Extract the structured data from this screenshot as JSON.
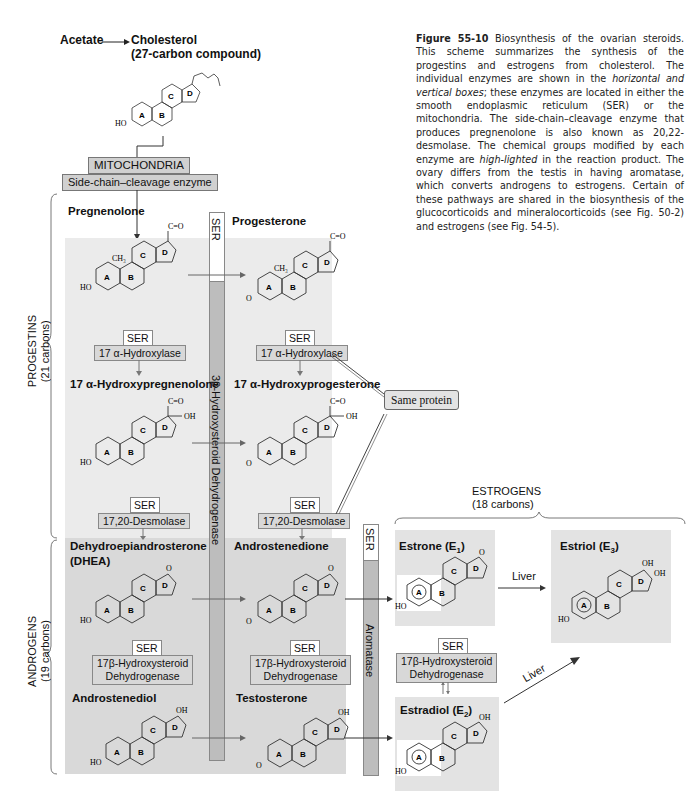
{
  "header": {
    "acetate": "Acetate",
    "arrow": "→",
    "cholesterol": "Cholesterol",
    "cholesterol_sub": "(27-carbon compound)"
  },
  "caption": {
    "figure_label": "Figure 55-10",
    "text_1": " Biosynthesis of the ovarian steroids. This scheme summarizes the synthesis of the progestins and estrogens from cholesterol. The individual enzymes are shown in the ",
    "text_italic_1": "horizontal and vertical boxes",
    "text_2": "; these enzymes are located in either the smooth endoplasmic reticulum (SER) or the mitochondria. The side-chain–cleavage enzyme that produces pregnenolone is also known as 20,22-desmolase. The chemical groups modified by each enzyme are ",
    "text_italic_2": "high-lighted",
    "text_3": " in the reaction product. The ovary differs from the testis in having aromatase, which converts androgens to estrogens. Certain of these pathways are shared in the biosynthesis of the glucocorticoids and mineralocorticoids (see Fig. 50-2) and estrogens (see Fig. 54-5)."
  },
  "mitochondria": {
    "location": "MITOCHONDRIA",
    "enzyme": "Side-chain–cleavage enzyme"
  },
  "groups": {
    "progestins": {
      "name": "PROGESTINS",
      "sub": "(21 carbons)"
    },
    "androgens": {
      "name": "ANDROGENS",
      "sub": "(19 carbons)"
    },
    "estrogens": {
      "name": "ESTROGENS",
      "sub": "(18 carbons)"
    }
  },
  "compounds": {
    "pregnenolone": "Pregnenolone",
    "progesterone": "Progesterone",
    "hydroxypregnenolone": "17 α-Hydroxypregnenolone",
    "hydroxyprogesterone": "17 α-Hydroxyprogesterone",
    "dhea_1": "Dehydroepiandrosterone",
    "dhea_2": "(DHEA)",
    "androstenedione": "Androstenedione",
    "androstenediol": "Androstenediol",
    "testosterone": "Testosterone",
    "estrone": "Estrone (E",
    "estrone_sub": "1",
    "estradiol": "Estradiol (E",
    "estradiol_sub": "2",
    "estriol": "Estriol (E",
    "estriol_sub": "3",
    "close_paren": ")"
  },
  "enzymes": {
    "ser": "SER",
    "hydroxylase": "17 α-Hydroxylase",
    "desmolase": "17,20-Desmolase",
    "hsd17_1": "17β-Hydroxysteroid",
    "hsd17_2": "Dehydrogenase",
    "hsd3": "3β-Hydroxysteroid Dehydrogenase",
    "aromatase": "Aromatase"
  },
  "annotations": {
    "same_protein": "Same protein",
    "liver": "Liver"
  },
  "mol_labels": {
    "ring_a": "A",
    "ring_b": "B",
    "ring_c": "C",
    "ring_d": "D",
    "ho": "HO",
    "o": "O",
    "oh": "OH",
    "ch3": "CH₃",
    "co": "C=O"
  },
  "colors": {
    "progestin_bg": "#ebebeb",
    "androgen_bg": "#d9d9d9",
    "enzyme_bg": "#d8d8d8",
    "bar_dark": "#bdbdbd"
  }
}
